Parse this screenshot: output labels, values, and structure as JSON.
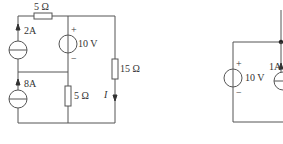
{
  "figure": {
    "type": "circuit-diagram",
    "left_circuit": {
      "components": [
        {
          "id": "R_top",
          "kind": "resistor",
          "label": "5 Ω"
        },
        {
          "id": "I_2A",
          "kind": "current-source",
          "label": "2A",
          "direction": "up"
        },
        {
          "id": "I_8A",
          "kind": "current-source",
          "label": "8A",
          "direction": "up"
        },
        {
          "id": "V_10",
          "kind": "voltage-source",
          "label": "10 V",
          "plus": "+",
          "minus": "−"
        },
        {
          "id": "R_mid",
          "kind": "resistor",
          "label": "5 Ω"
        },
        {
          "id": "R_right",
          "kind": "resistor",
          "label": "15 Ω"
        },
        {
          "id": "I_current",
          "kind": "current-label",
          "label": "I",
          "direction": "down"
        }
      ]
    },
    "right_circuit": {
      "components": [
        {
          "id": "V_10b",
          "kind": "voltage-source",
          "label": "10 V",
          "plus": "+",
          "minus": "−"
        },
        {
          "id": "I_1A",
          "kind": "current-source",
          "label": "1A",
          "direction": "up"
        }
      ]
    }
  }
}
